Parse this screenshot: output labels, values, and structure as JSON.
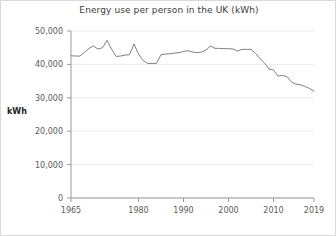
{
  "chart_data": {
    "type": "line",
    "title": "Energy use per person in the UK (kWh)",
    "xlabel": "",
    "ylabel": "kWh",
    "xlim": [
      1965,
      2019
    ],
    "ylim": [
      0,
      50000
    ],
    "grid": true,
    "legend": false,
    "y_ticks": [
      0,
      10000,
      20000,
      30000,
      40000,
      50000
    ],
    "y_tick_labels": [
      "0",
      "10,000",
      "20,000",
      "30,000",
      "40,000",
      "50,000"
    ],
    "x_ticks": [
      1965,
      1980,
      1990,
      2000,
      2010,
      2019
    ],
    "x_tick_labels": [
      "1965",
      "1980",
      "1990",
      "2000",
      "2010",
      "2019"
    ],
    "line_color": "#808080",
    "series": [
      {
        "name": "Energy use per person",
        "x": [
          1965,
          1966,
          1967,
          1968,
          1969,
          1970,
          1971,
          1972,
          1973,
          1974,
          1975,
          1976,
          1977,
          1978,
          1979,
          1980,
          1981,
          1982,
          1983,
          1984,
          1985,
          1986,
          1987,
          1988,
          1989,
          1990,
          1991,
          1992,
          1993,
          1994,
          1995,
          1996,
          1997,
          1998,
          1999,
          2000,
          2001,
          2002,
          2003,
          2004,
          2005,
          2006,
          2007,
          2008,
          2009,
          2010,
          2011,
          2012,
          2013,
          2014,
          2015,
          2016,
          2017,
          2018,
          2019
        ],
        "values": [
          42600,
          42500,
          42500,
          43600,
          44800,
          45500,
          44600,
          45000,
          47200,
          44600,
          42400,
          42500,
          42800,
          42900,
          46100,
          43100,
          41200,
          40300,
          40300,
          40300,
          42900,
          43100,
          43200,
          43400,
          43500,
          43900,
          44100,
          43700,
          43500,
          43700,
          44300,
          45500,
          44800,
          44800,
          44700,
          44700,
          44600,
          44000,
          44500,
          44500,
          44500,
          43300,
          41700,
          40400,
          38600,
          38300,
          36500,
          36700,
          36300,
          34700,
          34100,
          33900,
          33400,
          32800,
          32000
        ]
      }
    ]
  }
}
